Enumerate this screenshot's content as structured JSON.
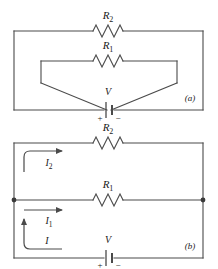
{
  "figure": {
    "type": "circuit-diagram",
    "panels": [
      {
        "id": "a",
        "panel_label": "(a)",
        "description": "Outer loop with R2; inner funnel-shaped loop with R1; both converge on battery V",
        "components": [
          {
            "name": "resistor",
            "label": "R",
            "subscript": "2",
            "position": "outer-top"
          },
          {
            "name": "resistor",
            "label": "R",
            "subscript": "1",
            "position": "inner-top"
          },
          {
            "name": "battery",
            "label": "V",
            "plus": "+",
            "minus": "−",
            "position": "bottom-center"
          }
        ]
      },
      {
        "id": "b",
        "panel_label": "(b)",
        "description": "Redrawn ladder: R2 on top branch, R1 on middle branch, battery V on bottom branch, with currents I2, I1 and I marked",
        "components": [
          {
            "name": "resistor",
            "label": "R",
            "subscript": "2",
            "position": "top-branch"
          },
          {
            "name": "resistor",
            "label": "R",
            "subscript": "1",
            "position": "middle-branch"
          },
          {
            "name": "battery",
            "label": "V",
            "plus": "+",
            "minus": "−",
            "position": "bottom-branch"
          }
        ],
        "currents": [
          {
            "label": "I",
            "subscript": "2",
            "direction": "right",
            "branch": "top"
          },
          {
            "label": "I",
            "subscript": "1",
            "direction": "right",
            "branch": "middle"
          },
          {
            "label": "I",
            "subscript": "",
            "direction": "up",
            "branch": "bottom-left"
          }
        ],
        "junctions": 2
      }
    ],
    "labels": {
      "r1": "R",
      "r1_sub": "1",
      "r2": "R",
      "r2_sub": "2",
      "v": "V",
      "plus": "+",
      "minus": "−",
      "i": "I",
      "i1": "I",
      "i1_sub": "1",
      "i2": "I",
      "i2_sub": "2",
      "panel_a": "(a)",
      "panel_b": "(b)"
    },
    "colors": {
      "wire": "#4a4a4a",
      "text": "#1a1a1a",
      "background": "#ffffff"
    }
  }
}
